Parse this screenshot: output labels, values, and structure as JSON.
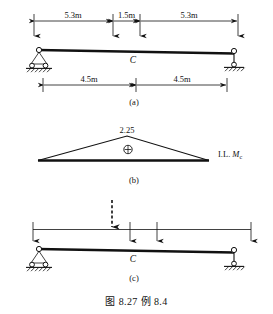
{
  "figure": {
    "caption": "图 8.27  例 8.4",
    "caption_figure_number": "8.27",
    "caption_example_number": "8.4"
  },
  "panels": [
    {
      "id": "a",
      "label": "(a)",
      "description": "beam-with-dimensions",
      "point_label": "C",
      "top_dimensions": [
        {
          "text": "5.3m",
          "value": 5.3,
          "unit": "m"
        },
        {
          "text": "1.5m",
          "value": 1.5,
          "unit": "m"
        },
        {
          "text": "5.3m",
          "value": 5.3,
          "unit": "m"
        }
      ],
      "bottom_dimensions": [
        {
          "text": "4.5m",
          "value": 4.5,
          "unit": "m"
        },
        {
          "text": "4.5m",
          "value": 4.5,
          "unit": "m"
        }
      ],
      "supports": [
        {
          "type": "pin-rocker-support",
          "position": "left"
        },
        {
          "type": "link-roller-support",
          "position": "right"
        }
      ]
    },
    {
      "id": "b",
      "label": "(b)",
      "description": "influence-line-diagram",
      "peak_value": "2.25",
      "sign_symbol": "⊕",
      "diagram_label_prefix": "I.L.",
      "diagram_label_symbol": "M",
      "diagram_label_subscript": "c"
    },
    {
      "id": "c",
      "label": "(c)",
      "description": "beam-with-moving-load",
      "point_label": "C",
      "load_indicator": "dashed-down-arrow",
      "supports": [
        {
          "type": "pin-rocker-support",
          "position": "left"
        },
        {
          "type": "link-roller-support",
          "position": "right"
        }
      ]
    }
  ],
  "colors": {
    "ink": "#111111",
    "background": "#ffffff"
  }
}
